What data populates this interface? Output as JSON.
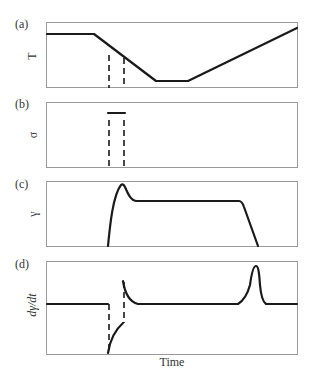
{
  "figure": {
    "xlabel": "Time",
    "panels": [
      {
        "id": "a",
        "label": "(a)",
        "ylabel": "T",
        "description": "Temperature: constant, linear cooling, hold at minimum, linear reheating"
      },
      {
        "id": "b",
        "label": "(b)",
        "ylabel": "σ",
        "description": "Stress applied briefly as a short constant pulse during cooling"
      },
      {
        "id": "c",
        "label": "(c)",
        "ylabel": "γ",
        "description": "Strain rises sharply, overshoots, plateaus, then recovers to zero on reheating"
      },
      {
        "id": "d",
        "label": "(d)",
        "ylabel": "dγ/dt",
        "description": "Strain rate: zero baseline, negative excursion then positive spike at load events, later sharp positive peak during recovery"
      }
    ],
    "dashed_markers": [
      "load start",
      "load end"
    ]
  }
}
